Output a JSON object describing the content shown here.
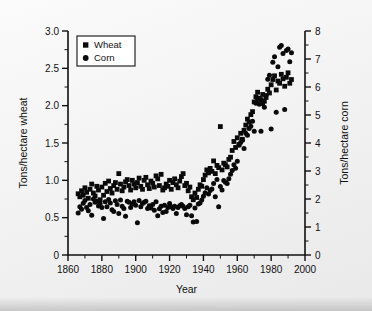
{
  "chart_data": {
    "type": "scatter",
    "title": "",
    "xlabel": "Year",
    "ylabel": "Tons/hectare wheat",
    "y2label": "Tons/hectare corn",
    "xlim": [
      1860,
      2000
    ],
    "ylim": [
      0,
      3.0
    ],
    "y2lim": [
      0,
      8
    ],
    "grid": false,
    "legend_position": "top-left",
    "xticks": [
      1860,
      1880,
      1900,
      1920,
      1940,
      1960,
      1980,
      2000
    ],
    "xtick_labels": [
      "1860",
      "1880",
      "1900",
      "1920",
      "1940",
      "1960",
      "1980",
      "2000"
    ],
    "xminor_step": 10,
    "yticks": [
      0,
      0.5,
      1.0,
      1.5,
      2.0,
      2.5,
      3.0
    ],
    "ytick_labels": [
      "0",
      "0.5",
      "1.0",
      "1.5",
      "2.0",
      "2.5",
      "3.0"
    ],
    "yminor_step": 0.25,
    "y2ticks": [
      0,
      1,
      2,
      3,
      4,
      5,
      6,
      7,
      8
    ],
    "y2tick_labels": [
      "0",
      "1",
      "2",
      "3",
      "4",
      "5",
      "6",
      "7",
      "8"
    ],
    "y2minor_step": 0.5,
    "marker_color": "#0a0a0a",
    "axis_color": "#111111",
    "series": [
      {
        "name": "Wheat",
        "marker": "square",
        "axis": "left",
        "unit": "tons/hectare",
        "points": [
          [
            1866,
            0.82
          ],
          [
            1867,
            0.78
          ],
          [
            1868,
            0.86
          ],
          [
            1869,
            0.8
          ],
          [
            1870,
            0.9
          ],
          [
            1871,
            0.84
          ],
          [
            1872,
            0.76
          ],
          [
            1873,
            0.88
          ],
          [
            1874,
            0.95
          ],
          [
            1875,
            0.83
          ],
          [
            1876,
            0.79
          ],
          [
            1877,
            0.92
          ],
          [
            1878,
            0.87
          ],
          [
            1879,
            0.74
          ],
          [
            1880,
            0.91
          ],
          [
            1881,
            0.8
          ],
          [
            1882,
            0.96
          ],
          [
            1883,
            0.85
          ],
          [
            1884,
            0.99
          ],
          [
            1885,
            0.89
          ],
          [
            1886,
            0.83
          ],
          [
            1887,
            0.93
          ],
          [
            1888,
            0.97
          ],
          [
            1889,
            0.88
          ],
          [
            1890,
            1.09
          ],
          [
            1891,
            0.95
          ],
          [
            1892,
            0.86
          ],
          [
            1893,
            0.91
          ],
          [
            1894,
            0.98
          ],
          [
            1895,
            1.01
          ],
          [
            1896,
            0.93
          ],
          [
            1897,
            0.87
          ],
          [
            1898,
            1.0
          ],
          [
            1899,
            0.95
          ],
          [
            1900,
            0.9
          ],
          [
            1901,
            0.97
          ],
          [
            1902,
            1.03
          ],
          [
            1903,
            0.92
          ],
          [
            1904,
            0.88
          ],
          [
            1905,
            1.0
          ],
          [
            1906,
            1.04
          ],
          [
            1907,
            0.94
          ],
          [
            1908,
            0.89
          ],
          [
            1909,
            0.99
          ],
          [
            1910,
            0.96
          ],
          [
            1911,
            0.91
          ],
          [
            1912,
            1.06
          ],
          [
            1913,
            1.02
          ],
          [
            1914,
            0.93
          ],
          [
            1915,
            1.08
          ],
          [
            1916,
            0.87
          ],
          [
            1917,
            0.9
          ],
          [
            1918,
            0.95
          ],
          [
            1919,
            0.92
          ],
          [
            1920,
            1.0
          ],
          [
            1921,
            0.88
          ],
          [
            1922,
            0.97
          ],
          [
            1923,
            1.02
          ],
          [
            1924,
            0.94
          ],
          [
            1925,
            0.9
          ],
          [
            1926,
            0.99
          ],
          [
            1927,
            1.05
          ],
          [
            1928,
            1.09
          ],
          [
            1929,
            0.93
          ],
          [
            1930,
            0.96
          ],
          [
            1931,
            0.86
          ],
          [
            1932,
            0.91
          ],
          [
            1933,
            0.78
          ],
          [
            1934,
            0.74
          ],
          [
            1935,
            0.83
          ],
          [
            1936,
            0.77
          ],
          [
            1937,
            0.88
          ],
          [
            1938,
            0.94
          ],
          [
            1939,
            0.92
          ],
          [
            1940,
            1.01
          ],
          [
            1941,
            1.07
          ],
          [
            1942,
            1.14
          ],
          [
            1943,
            1.1
          ],
          [
            1944,
            1.16
          ],
          [
            1945,
            1.12
          ],
          [
            1946,
            1.26
          ],
          [
            1947,
            1.09
          ],
          [
            1948,
            1.2
          ],
          [
            1949,
            1.17
          ],
          [
            1950,
            1.72
          ],
          [
            1951,
            1.14
          ],
          [
            1952,
            1.23
          ],
          [
            1953,
            1.21
          ],
          [
            1954,
            1.18
          ],
          [
            1955,
            1.28
          ],
          [
            1956,
            1.31
          ],
          [
            1957,
            1.4
          ],
          [
            1958,
            1.52
          ],
          [
            1959,
            1.44
          ],
          [
            1960,
            1.57
          ],
          [
            1961,
            1.48
          ],
          [
            1962,
            1.63
          ],
          [
            1963,
            1.55
          ],
          [
            1964,
            1.67
          ],
          [
            1965,
            1.74
          ],
          [
            1966,
            1.82
          ],
          [
            1967,
            1.78
          ],
          [
            1968,
            1.88
          ],
          [
            1969,
            1.92
          ],
          [
            1970,
            2.05
          ],
          [
            1971,
            2.12
          ],
          [
            1972,
            2.18
          ],
          [
            1973,
            2.1
          ],
          [
            1974,
            2.08
          ],
          [
            1975,
            2.15
          ],
          [
            1976,
            2.06
          ],
          [
            1977,
            2.11
          ],
          [
            1978,
            2.22
          ],
          [
            1979,
            2.17
          ],
          [
            1980,
            2.28
          ],
          [
            1981,
            2.35
          ],
          [
            1982,
            2.4
          ],
          [
            1983,
            2.21
          ],
          [
            1984,
            2.33
          ],
          [
            1985,
            2.3
          ],
          [
            1986,
            2.42
          ],
          [
            1987,
            2.36
          ],
          [
            1988,
            2.26
          ],
          [
            1989,
            2.38
          ],
          [
            1990,
            2.44
          ],
          [
            1991,
            2.3
          ],
          [
            1992,
            2.35
          ]
        ]
      },
      {
        "name": "Corn",
        "marker": "circle",
        "axis": "right",
        "unit": "tons/hectare",
        "points": [
          [
            1866,
            1.5
          ],
          [
            1867,
            1.72
          ],
          [
            1868,
            1.63
          ],
          [
            1869,
            1.85
          ],
          [
            1870,
            1.95
          ],
          [
            1871,
            1.7
          ],
          [
            1872,
            1.58
          ],
          [
            1873,
            1.8
          ],
          [
            1874,
            1.42
          ],
          [
            1875,
            2.0
          ],
          [
            1876,
            1.88
          ],
          [
            1877,
            1.92
          ],
          [
            1878,
            1.75
          ],
          [
            1879,
            1.83
          ],
          [
            1880,
            1.7
          ],
          [
            1881,
            1.3
          ],
          [
            1882,
            1.9
          ],
          [
            1883,
            1.72
          ],
          [
            1884,
            1.98
          ],
          [
            1885,
            1.86
          ],
          [
            1886,
            1.62
          ],
          [
            1887,
            1.55
          ],
          [
            1888,
            1.94
          ],
          [
            1889,
            1.8
          ],
          [
            1890,
            1.48
          ],
          [
            1891,
            1.96
          ],
          [
            1892,
            1.74
          ],
          [
            1893,
            1.66
          ],
          [
            1894,
            1.38
          ],
          [
            1895,
            1.92
          ],
          [
            1896,
            1.88
          ],
          [
            1897,
            1.7
          ],
          [
            1898,
            1.82
          ],
          [
            1899,
            1.9
          ],
          [
            1900,
            1.78
          ],
          [
            1901,
            1.15
          ],
          [
            1902,
            1.95
          ],
          [
            1903,
            1.72
          ],
          [
            1904,
            1.84
          ],
          [
            1905,
            1.88
          ],
          [
            1906,
            1.92
          ],
          [
            1907,
            1.66
          ],
          [
            1908,
            1.76
          ],
          [
            1909,
            1.68
          ],
          [
            1910,
            1.8
          ],
          [
            1911,
            1.6
          ],
          [
            1912,
            1.9
          ],
          [
            1913,
            1.4
          ],
          [
            1914,
            1.65
          ],
          [
            1915,
            1.74
          ],
          [
            1916,
            1.52
          ],
          [
            1917,
            1.78
          ],
          [
            1918,
            1.55
          ],
          [
            1919,
            1.7
          ],
          [
            1920,
            1.84
          ],
          [
            1921,
            1.72
          ],
          [
            1922,
            1.66
          ],
          [
            1923,
            1.74
          ],
          [
            1924,
            1.48
          ],
          [
            1925,
            1.7
          ],
          [
            1926,
            1.76
          ],
          [
            1927,
            1.8
          ],
          [
            1928,
            1.74
          ],
          [
            1929,
            1.66
          ],
          [
            1930,
            1.44
          ],
          [
            1931,
            1.72
          ],
          [
            1932,
            1.78
          ],
          [
            1933,
            1.4
          ],
          [
            1934,
            1.18
          ],
          [
            1935,
            1.68
          ],
          [
            1936,
            1.2
          ],
          [
            1937,
            1.82
          ],
          [
            1938,
            1.86
          ],
          [
            1939,
            1.96
          ],
          [
            1940,
            2.1
          ],
          [
            1941,
            2.22
          ],
          [
            1942,
            2.4
          ],
          [
            1943,
            2.18
          ],
          [
            1944,
            2.3
          ],
          [
            1945,
            2.36
          ],
          [
            1946,
            2.55
          ],
          [
            1947,
            2.08
          ],
          [
            1948,
            2.7
          ],
          [
            1949,
            1.72
          ],
          [
            1950,
            2.45
          ],
          [
            1951,
            2.32
          ],
          [
            1952,
            2.66
          ],
          [
            1953,
            2.6
          ],
          [
            1954,
            2.55
          ],
          [
            1955,
            2.72
          ],
          [
            1956,
            2.88
          ],
          [
            1957,
            3.02
          ],
          [
            1958,
            3.22
          ],
          [
            1959,
            3.1
          ],
          [
            1960,
            3.35
          ],
          [
            1961,
            3.92
          ],
          [
            1962,
            4.02
          ],
          [
            1963,
            4.1
          ],
          [
            1964,
            3.8
          ],
          [
            1965,
            4.35
          ],
          [
            1966,
            4.28
          ],
          [
            1967,
            4.52
          ],
          [
            1968,
            4.6
          ],
          [
            1969,
            4.78
          ],
          [
            1970,
            4.42
          ],
          [
            1971,
            5.42
          ],
          [
            1972,
            5.55
          ],
          [
            1973,
            5.38
          ],
          [
            1974,
            4.42
          ],
          [
            1975,
            5.4
          ],
          [
            1976,
            5.28
          ],
          [
            1977,
            5.7
          ],
          [
            1978,
            6.28
          ],
          [
            1979,
            6.42
          ],
          [
            1980,
            4.5
          ],
          [
            1981,
            6.88
          ],
          [
            1982,
            7.08
          ],
          [
            1983,
            5.1
          ],
          [
            1984,
            6.72
          ],
          [
            1985,
            7.42
          ],
          [
            1986,
            7.48
          ],
          [
            1987,
            7.2
          ],
          [
            1988,
            5.2
          ],
          [
            1989,
            7.3
          ],
          [
            1990,
            7.36
          ],
          [
            1991,
            6.9
          ],
          [
            1992,
            7.22
          ]
        ]
      }
    ]
  }
}
